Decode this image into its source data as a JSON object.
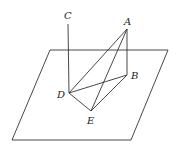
{
  "diagram": {
    "type": "3d-geometry",
    "plane": {
      "points": [
        [
          50,
          50
        ],
        [
          168,
          50
        ],
        [
          131,
          140
        ],
        [
          12,
          140
        ]
      ]
    },
    "points": {
      "A": {
        "label": "A",
        "x": 127,
        "y": 29,
        "lx": 124,
        "ly": 25
      },
      "B": {
        "label": "B",
        "x": 127,
        "y": 75,
        "lx": 131,
        "ly": 79
      },
      "C": {
        "label": "C",
        "x": 68,
        "y": 24,
        "lx": 64,
        "ly": 19
      },
      "D": {
        "label": "D",
        "x": 69,
        "y": 93,
        "lx": 57,
        "ly": 98
      },
      "E": {
        "label": "E",
        "x": 91,
        "y": 111,
        "lx": 87,
        "ly": 124
      }
    },
    "segments": [
      [
        "C",
        "D"
      ],
      [
        "A",
        "B"
      ],
      [
        "A",
        "D"
      ],
      [
        "A",
        "E"
      ],
      [
        "D",
        "B"
      ],
      [
        "D",
        "E"
      ],
      [
        "E",
        "B"
      ]
    ]
  }
}
